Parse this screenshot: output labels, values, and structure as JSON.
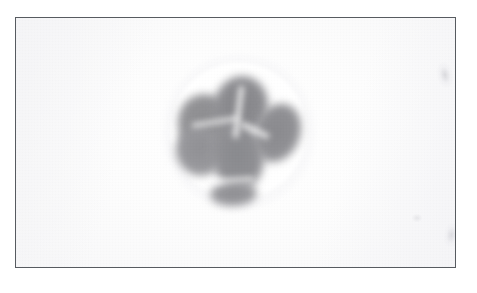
{
  "page": {
    "background_color": "#ffffff",
    "width_px": 477,
    "height_px": 293
  },
  "ghost_text_strip": {
    "description": "faint illegible bleed-through text along very top edge",
    "fragments": [
      "",
      "",
      "",
      "",
      ""
    ]
  },
  "figure": {
    "frame": {
      "border_color": "#575b60",
      "fill_color": "#fbfbfc",
      "left_px": 15,
      "top_px": 17,
      "width_px": 441,
      "height_px": 251
    },
    "caption": "",
    "specimen": {
      "label": "",
      "halo_color": "#ffffff",
      "lobe_color": "#8d8d90",
      "center_x_px": 222,
      "center_y_px": 139,
      "diameter_px": 135,
      "lobe_count": 6,
      "lobes": [
        {
          "name": "upper-left",
          "tone": "#8d8d90"
        },
        {
          "name": "upper-center",
          "tone": "#86868a"
        },
        {
          "name": "right",
          "tone": "#8a8a8e"
        },
        {
          "name": "center-lower",
          "tone": "#898a8e"
        },
        {
          "name": "left-lower",
          "tone": "#909094"
        },
        {
          "name": "bottom-bud",
          "tone": "#8f8f93"
        }
      ]
    },
    "artifacts": [
      {
        "name": "upper-right-smudge",
        "tone": "#c4c4ca"
      },
      {
        "name": "lower-right-smudge",
        "tone": "#c6c6cc"
      },
      {
        "name": "mid-right-speck",
        "tone": "#cdcdd2"
      }
    ]
  }
}
